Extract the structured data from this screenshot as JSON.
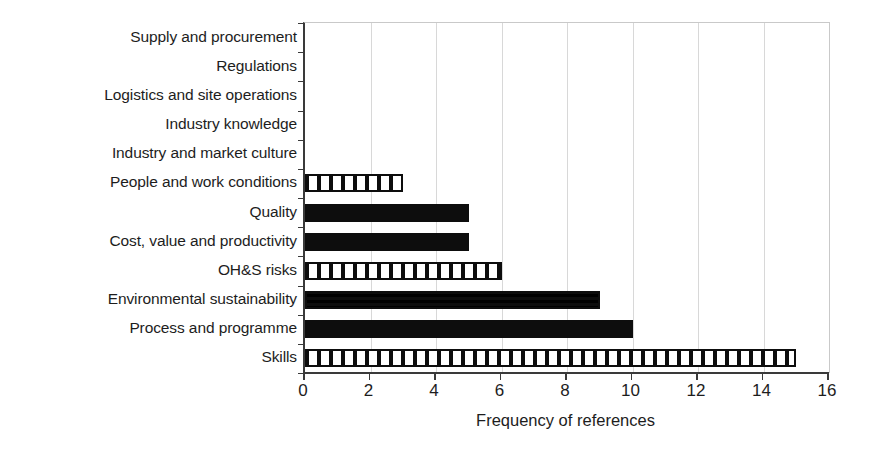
{
  "chart_data": {
    "type": "bar",
    "orientation": "horizontal",
    "title": "",
    "xlabel": "Frequency of references",
    "ylabel": "",
    "xlim": [
      0,
      16
    ],
    "xticks": [
      0,
      2,
      4,
      6,
      8,
      10,
      12,
      14,
      16
    ],
    "grid": "vertical",
    "legend": "none",
    "categories": [
      "Supply and procurement",
      "Regulations",
      "Logistics and site operations",
      "Industry knowledge",
      "Industry and market culture",
      "People and work conditions",
      "Quality",
      "Cost, value and productivity",
      "OH&S risks",
      "Environmental sustainability",
      "Process and programme",
      "Skills"
    ],
    "values": [
      0,
      0,
      0,
      0,
      0,
      3,
      5,
      5,
      6,
      9,
      10,
      15
    ],
    "fills": [
      "none",
      "none",
      "none",
      "none",
      "none",
      "vertical-stripe",
      "solid-black",
      "solid-black",
      "vertical-stripe",
      "checkerboard",
      "solid-black",
      "vertical-stripe"
    ],
    "colors": {
      "bar_fill": "#0d0d0d",
      "bar_background": "#ffffff",
      "axis": "#3a3a3a",
      "gridline": "#d8d8d8",
      "text": "#1d1d1d",
      "page_background": "#ffffff"
    }
  }
}
